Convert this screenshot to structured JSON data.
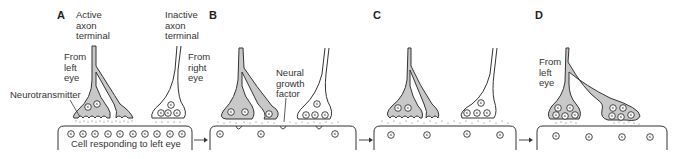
{
  "figure": {
    "type": "diagram",
    "panels": [
      {
        "id": "A",
        "letter": "A",
        "labels": {
          "active_terminal": "Active\naxon\nterminal",
          "inactive_terminal": "Inactive\naxon\nterminal",
          "from_left": "From\nleft\neye",
          "from_right": "From\nright\neye",
          "neurotransmitter": "Neurotransmitter",
          "cell": "Cell responding to left eye"
        }
      },
      {
        "id": "B",
        "letter": "B",
        "labels": {
          "growth_factor": "Neural\ngrowth\nfactor"
        }
      },
      {
        "id": "C",
        "letter": "C",
        "labels": {}
      },
      {
        "id": "D",
        "letter": "D",
        "labels": {
          "from_left": "From\nleft\neye"
        }
      }
    ],
    "arrows": [
      "A→B",
      "B→C",
      "C→D"
    ],
    "colors": {
      "active_fill": "#c8c8c8",
      "inactive_fill": "#ffffff",
      "stroke": "#333333",
      "background": "#ffffff"
    }
  }
}
